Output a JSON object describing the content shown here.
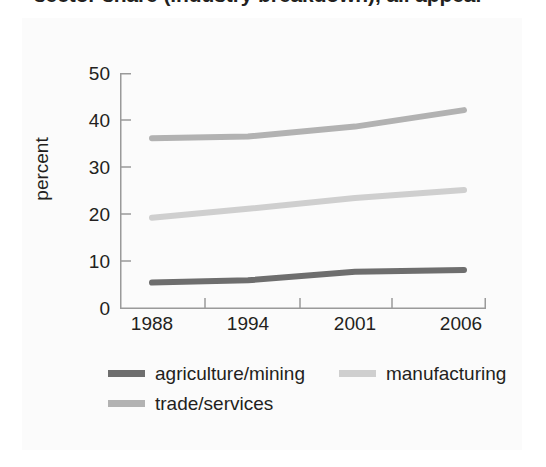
{
  "figure": {
    "title_partial": "sector share (industry breakdown), all appear",
    "background": "#ffffff"
  },
  "chart_data": {
    "type": "line",
    "title": "",
    "xlabel": "",
    "ylabel": "percent",
    "categories": [
      "1988",
      "1994",
      "2001",
      "2006"
    ],
    "x": [
      1988,
      1994,
      2001,
      2006
    ],
    "xlim": [
      1986,
      2008
    ],
    "ylim": [
      0,
      50
    ],
    "yticks": [
      0,
      10,
      20,
      30,
      40,
      50
    ],
    "ytick_labels": [
      "0",
      "10",
      "20",
      "30",
      "40",
      "50"
    ],
    "xtick_labels": [
      "1988",
      "1994",
      "2001",
      "2006"
    ],
    "grid": false,
    "legend_position": "below",
    "series": [
      {
        "name": "agriculture/mining",
        "color": "#6e6e6e",
        "values": [
          5.4,
          5.9,
          7.7,
          8.1
        ]
      },
      {
        "name": "manufacturing",
        "color": "#cfcfcf",
        "values": [
          19.2,
          21.1,
          23.4,
          25.1
        ]
      },
      {
        "name": "trade/services",
        "color": "#b2b2b2",
        "values": [
          36.1,
          36.5,
          38.6,
          42.1
        ]
      }
    ]
  },
  "axis": {
    "line_color": "#9a9a9a",
    "tick_color": "#9a9a9a"
  },
  "legend": {
    "rows": [
      [
        {
          "label": "agriculture/mining",
          "color": "#6e6e6e",
          "name": "agriculture-mining"
        },
        {
          "label": "manufacturing",
          "color": "#cfcfcf",
          "name": "manufacturing"
        }
      ],
      [
        {
          "label": "trade/services",
          "color": "#b2b2b2",
          "name": "trade-services"
        }
      ]
    ]
  }
}
